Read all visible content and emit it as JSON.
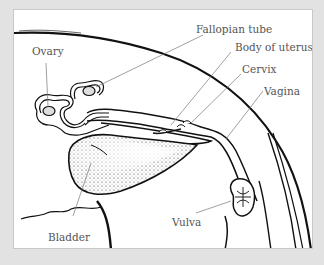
{
  "figure": {
    "background_color": "#e2e2e2",
    "panel_color": "#ffffff",
    "line_color": "#111111",
    "leader_color": "#666666",
    "labels": {
      "ovary": "Ovary",
      "fallopian_tube": "Fallopian tube",
      "body_of_uterus": "Body of uterus",
      "cervix": "Cervix",
      "vagina": "Vagina",
      "vulva": "Vulva",
      "bladder": "Bladder"
    }
  }
}
